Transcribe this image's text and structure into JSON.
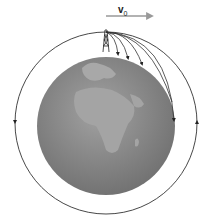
{
  "diagram": {
    "velocity_label": "v",
    "velocity_subscript": "0",
    "colors": {
      "earth": "#8a8a8a",
      "land": "#a0a0a0",
      "orbit_line": "#333333",
      "velocity_arrow": "#999999"
    },
    "elements": [
      "earth-globe",
      "tower",
      "trajectories",
      "circular-orbit",
      "velocity-arrow"
    ]
  }
}
